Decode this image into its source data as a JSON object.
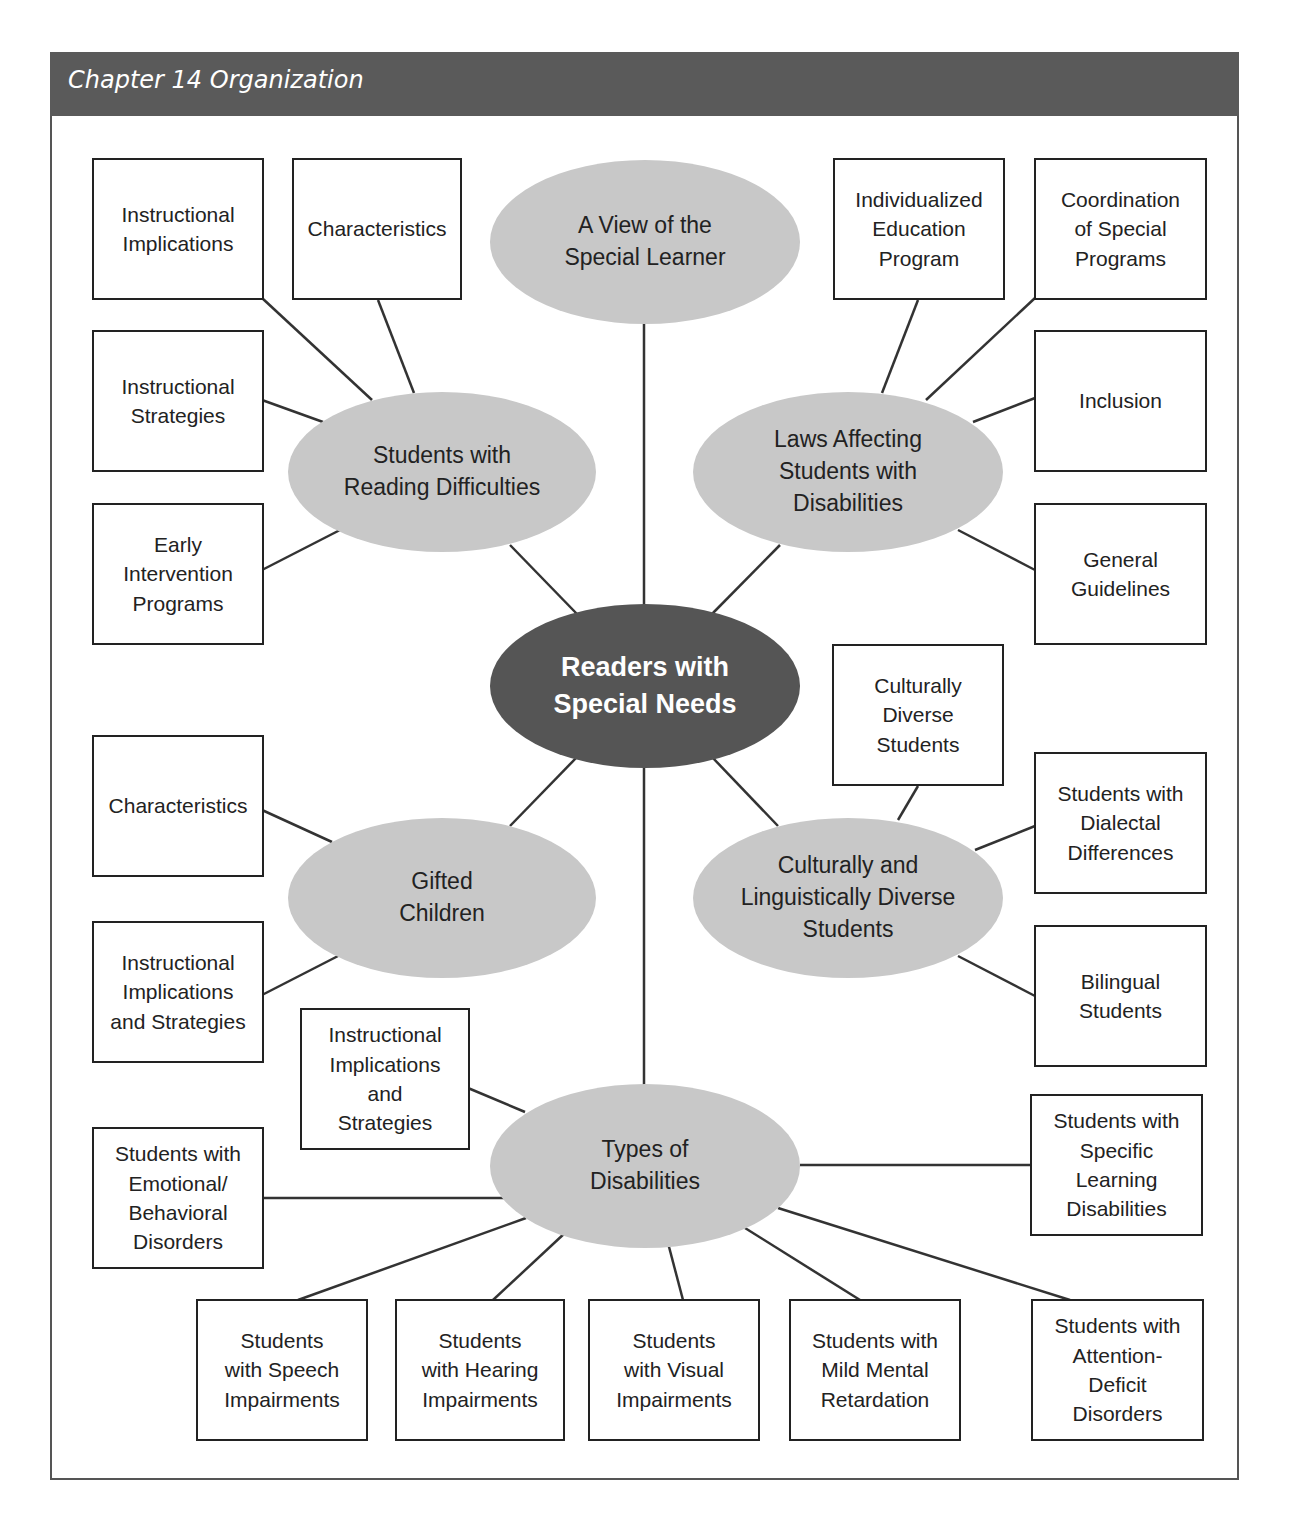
{
  "header": {
    "title": "Chapter 14 Organization"
  },
  "center": {
    "label": "Readers with\nSpecial Needs"
  },
  "ovals": {
    "view": "A View of the\nSpecial Learner",
    "reading": "Students with\nReading Difficulties",
    "laws": "Laws Affecting\nStudents with\nDisabilities",
    "gifted": "Gifted\nChildren",
    "cultural": "Culturally and\nLinguistically Diverse\nStudents",
    "types": "Types of\nDisabilities"
  },
  "boxes": {
    "reading_implications": "Instructional\nImplications",
    "reading_characteristics": "Characteristics",
    "reading_strategies": "Instructional\nStrategies",
    "reading_early": "Early\nIntervention\nPrograms",
    "laws_iep": "Individualized\nEducation\nProgram",
    "laws_coordination": "Coordination\nof Special\nPrograms",
    "laws_inclusion": "Inclusion",
    "laws_guidelines": "General\nGuidelines",
    "gifted_characteristics": "Characteristics",
    "gifted_implications": "Instructional\nImplications\nand Strategies",
    "cultural_diverse": "Culturally\nDiverse\nStudents",
    "cultural_dialectal": "Students with\nDialectal\nDifferences",
    "cultural_bilingual": "Bilingual\nStudents",
    "types_implications": "Instructional\nImplications\nand\nStrategies",
    "types_emotional": "Students with\nEmotional/\nBehavioral\nDisorders",
    "types_specific": "Students with\nSpecific\nLearning\nDisabilities",
    "types_speech": "Students\nwith Speech\nImpairments",
    "types_hearing": "Students\nwith Hearing\nImpairments",
    "types_visual": "Students\nwith Visual\nImpairments",
    "types_mental": "Students with\nMild Mental\nRetardation",
    "types_attention": "Students with\nAttention-\nDeficit\nDisorders"
  }
}
